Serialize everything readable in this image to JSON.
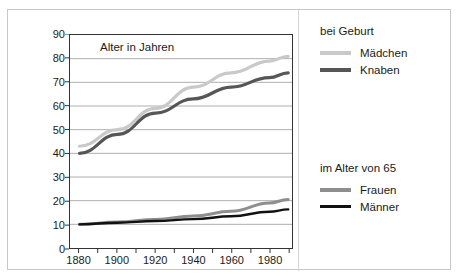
{
  "top_cut_text": "",
  "chart_data": {
    "type": "line",
    "title": "Alter in Jahren",
    "xlabel": "",
    "ylabel": "Alter in Jahren",
    "xlim": [
      1875,
      1992
    ],
    "ylim": [
      0,
      90
    ],
    "ytick_step": 10,
    "yticks": [
      0,
      10,
      20,
      30,
      40,
      50,
      60,
      70,
      80,
      90
    ],
    "ytick_labels": [
      "0",
      "10",
      "20",
      "30",
      "40",
      "50",
      "60",
      "70",
      "80",
      "90"
    ],
    "xticks_major": [
      1880,
      1900,
      1920,
      1940,
      1960,
      1980
    ],
    "xtick_labels": [
      "1880",
      "1900",
      "1920",
      "1940",
      "1960",
      "1980"
    ],
    "xticks_minor": [
      1890,
      1910,
      1930,
      1950,
      1970,
      1990
    ],
    "grid": "horizontal",
    "legend_position": "right",
    "x": [
      1880,
      1900,
      1920,
      1940,
      1960,
      1980,
      1990
    ],
    "series": [
      {
        "name": "Mädchen",
        "group": "bei Geburt",
        "color": "#c9c9c9",
        "width": 3.2,
        "values": [
          43,
          50,
          59,
          68,
          74,
          79,
          81
        ]
      },
      {
        "name": "Knaben",
        "group": "bei Geburt",
        "color": "#565656",
        "width": 3.2,
        "values": [
          40,
          48,
          57,
          63,
          68,
          72,
          74
        ]
      },
      {
        "name": "Frauen",
        "group": "im Alter von 65",
        "color": "#8e8e8e",
        "width": 3.0,
        "values": [
          10,
          11,
          12,
          13.5,
          15.5,
          19,
          20.5
        ]
      },
      {
        "name": "Männer",
        "group": "im Alter von 65",
        "color": "#111111",
        "width": 2.4,
        "values": [
          10,
          10.7,
          11.4,
          12.2,
          13.4,
          15.3,
          16.3
        ]
      }
    ]
  },
  "legend": {
    "groups": [
      {
        "heading": "bei Geburt",
        "entries": [
          {
            "label": "Mädchen",
            "color": "#c9c9c9"
          },
          {
            "label": "Knaben",
            "color": "#565656"
          }
        ]
      },
      {
        "heading": "im Alter von 65",
        "entries": [
          {
            "label": "Frauen",
            "color": "#8e8e8e"
          },
          {
            "label": "Männer",
            "color": "#111111"
          }
        ]
      }
    ]
  }
}
